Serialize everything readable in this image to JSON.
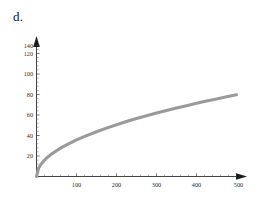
{
  "figure": {
    "panel_label": "d.",
    "background_color": "#ffffff"
  },
  "chart_data": {
    "type": "line",
    "title": "",
    "subtitle": "",
    "xlabel": "",
    "ylabel": "",
    "xlim": [
      0,
      520
    ],
    "ylim": [
      0,
      150
    ],
    "grid": false,
    "legend": null,
    "curve_color": "#9a9a9a",
    "curve_width": 3.1,
    "axis_color": "#2f2f2f",
    "x_ticks": [
      100,
      200,
      300,
      400,
      500
    ],
    "x_tick_labels": [
      "100",
      "200",
      "300",
      "400",
      "500"
    ],
    "x_minor_tick_step": 20,
    "y_ticks": [
      20,
      40,
      60,
      80,
      100,
      120,
      140
    ],
    "y_tick_labels": [
      "20",
      "40",
      "60",
      "80",
      "100",
      "120",
      "140"
    ],
    "y_minor_tick_step": 5,
    "series": [
      {
        "name": "curve",
        "description": "increasing concave square-root shaped curve",
        "x": [
          0,
          5,
          10,
          20,
          30,
          40,
          50,
          60,
          80,
          100,
          125,
          150,
          175,
          200,
          225,
          250,
          275,
          300,
          325,
          350,
          375,
          400,
          425,
          450,
          475,
          500
        ],
        "values": [
          0,
          8.0,
          11.3,
          16.0,
          19.6,
          22.6,
          25.2,
          27.7,
          31.9,
          35.7,
          39.9,
          43.7,
          47.2,
          50.5,
          53.6,
          56.5,
          59.2,
          61.9,
          64.4,
          66.8,
          69.1,
          71.4,
          73.6,
          75.7,
          77.8,
          79.8
        ]
      }
    ]
  }
}
